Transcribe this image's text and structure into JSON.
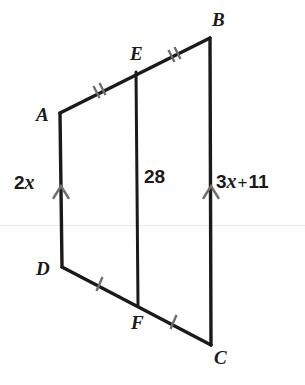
{
  "figure": {
    "type": "geometry-diagram",
    "background_color": "#ffffff",
    "stroke_color": "#1a1a1a",
    "tick_color": "#6e6e6e",
    "artifact_line_color": "#e9e9ea",
    "vertices": [
      {
        "name": "A",
        "label": "A",
        "x": 60,
        "y": 113
      },
      {
        "name": "B",
        "label": "B",
        "x": 210,
        "y": 38
      },
      {
        "name": "C",
        "label": "C",
        "x": 211,
        "y": 345
      },
      {
        "name": "D",
        "label": "D",
        "x": 62,
        "y": 267
      },
      {
        "name": "E",
        "label": "E",
        "x": 136,
        "y": 72
      },
      {
        "name": "F",
        "label": "F",
        "x": 138,
        "y": 305
      }
    ],
    "segments": [
      {
        "name": "AE",
        "from": "A",
        "to": "E",
        "ticks": 2
      },
      {
        "name": "EB",
        "from": "E",
        "to": "B",
        "ticks": 2
      },
      {
        "name": "DF",
        "from": "D",
        "to": "F",
        "ticks": 1
      },
      {
        "name": "FC",
        "from": "F",
        "to": "C",
        "ticks": 1
      },
      {
        "name": "AD",
        "from": "A",
        "to": "D",
        "ticks": 0,
        "arrow_marks": 1
      },
      {
        "name": "BC",
        "from": "B",
        "to": "C",
        "ticks": 0,
        "arrow_marks": 1
      },
      {
        "name": "EF",
        "from": "E",
        "to": "F",
        "ticks": 0
      }
    ],
    "measures": {
      "left_side": {
        "segment": "AD",
        "text": "2x",
        "coefficient": 2,
        "variable": "x"
      },
      "midsegment": {
        "segment": "EF",
        "text": "28",
        "value": 28
      },
      "right_side": {
        "segment": "BC",
        "text": "3x + 11",
        "coefficient": 3,
        "variable": "x",
        "operator": "+",
        "constant": 11
      }
    }
  }
}
